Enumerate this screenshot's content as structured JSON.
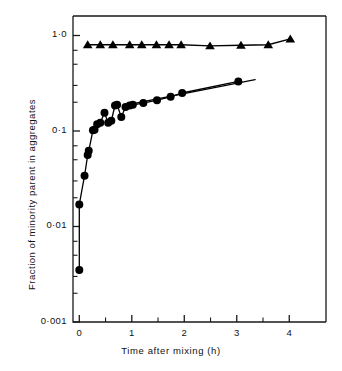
{
  "chart_data": {
    "type": "scatter",
    "title": "",
    "xlabel": "Time after mixing (h)",
    "ylabel": "Fraction of minority parent in aggregates",
    "xlim": [
      -0.12,
      4.7
    ],
    "ylim": [
      0.001,
      1.6
    ],
    "yscale": "log",
    "xscale": "linear",
    "grid": false,
    "legend": "none",
    "xticks": [
      0,
      1,
      2,
      3,
      4
    ],
    "xtick_labels": [
      "0",
      "1",
      "2",
      "3",
      "4"
    ],
    "xminor_ticks": [
      0.5,
      1.5,
      2.5,
      3.5
    ],
    "yticks": [
      1.0,
      0.1,
      0.01,
      0.001
    ],
    "ytick_labels": [
      "1·0",
      "0·1",
      "0·01",
      "0·001"
    ],
    "yminor_ticks": [
      0.7,
      0.5,
      0.3,
      0.2,
      0.07,
      0.05,
      0.03,
      0.02,
      0.007,
      0.005,
      0.003,
      0.002
    ],
    "series": [
      {
        "name": "triangles",
        "marker": "triangle-up",
        "color": "#000000",
        "connected": true,
        "x": [
          0.16,
          0.4,
          0.64,
          0.96,
          1.19,
          1.47,
          1.71,
          1.94,
          2.49,
          3.08,
          3.6,
          4.02
        ],
        "y": [
          0.8,
          0.8,
          0.8,
          0.8,
          0.8,
          0.8,
          0.8,
          0.8,
          0.78,
          0.79,
          0.8,
          0.92
        ]
      },
      {
        "name": "circles",
        "marker": "circle",
        "color": "#000000",
        "connected": true,
        "x": [
          0.0,
          0.0,
          0.1,
          0.16,
          0.18,
          0.26,
          0.29,
          0.34,
          0.4,
          0.48,
          0.55,
          0.61,
          0.68,
          0.72,
          0.8,
          0.88,
          0.96,
          1.02,
          1.22,
          1.48,
          1.74,
          1.96,
          3.03
        ],
        "y": [
          0.0035,
          0.017,
          0.034,
          0.056,
          0.062,
          0.102,
          0.103,
          0.118,
          0.122,
          0.155,
          0.122,
          0.128,
          0.185,
          0.188,
          0.14,
          0.178,
          0.185,
          0.188,
          0.196,
          0.21,
          0.228,
          0.25,
          0.33
        ]
      }
    ],
    "trend_line_right": {
      "from_x": 1.0,
      "from_y": 0.192,
      "to_x": 3.35,
      "to_y": 0.345
    }
  },
  "axes": {
    "frame_color": "#1a1a1a",
    "background": "#ffffff"
  }
}
